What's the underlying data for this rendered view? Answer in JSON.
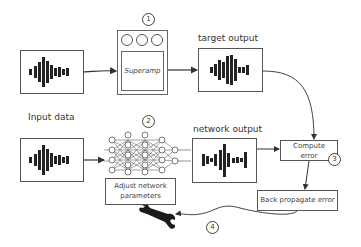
{
  "diagram": {
    "nodes": {
      "input_top": {
        "kind": "waveform",
        "icon": "waveform-icon"
      },
      "pedal": {
        "label": "Superamp",
        "icon": "guitar-pedal-icon",
        "knobs": 3
      },
      "target_output": {
        "label": "target output",
        "icon": "waveform-icon"
      },
      "input_bottom": {
        "label": "Input data",
        "icon": "waveform-icon"
      },
      "network": {
        "icon": "neural-network-icon"
      },
      "network_output": {
        "label": "network output",
        "icon": "waveform-icon"
      },
      "compute_error": {
        "label_line1": "Compute",
        "label_line2": "error"
      },
      "back_propagate": {
        "label": "Back propagate error"
      },
      "adjust_params": {
        "label_line1": "Adjust network",
        "label_line2": "parameters",
        "icon": "wrench-icon"
      }
    },
    "steps": [
      {
        "number": "1",
        "refers_to": "pedal"
      },
      {
        "number": "2",
        "refers_to": "network"
      },
      {
        "number": "3",
        "refers_to": "compute_error"
      },
      {
        "number": "4",
        "refers_to": "back_propagate"
      }
    ],
    "colors": {
      "stroke": "#555555",
      "waveform": "#222222",
      "background": "#ffffff"
    }
  }
}
